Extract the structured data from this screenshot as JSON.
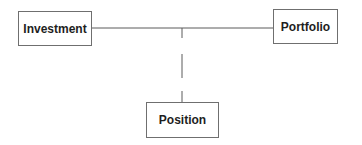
{
  "diagram": {
    "nodes": [
      {
        "id": "investment",
        "label": "Investment"
      },
      {
        "id": "portfolio",
        "label": "Portfolio"
      },
      {
        "id": "position",
        "label": "Position"
      }
    ],
    "edges": [
      {
        "from": "investment",
        "to": "portfolio",
        "style": "solid"
      },
      {
        "from": "investment-portfolio-link",
        "to": "position",
        "style": "dashed"
      }
    ],
    "line_color": "#5a5a5a"
  }
}
